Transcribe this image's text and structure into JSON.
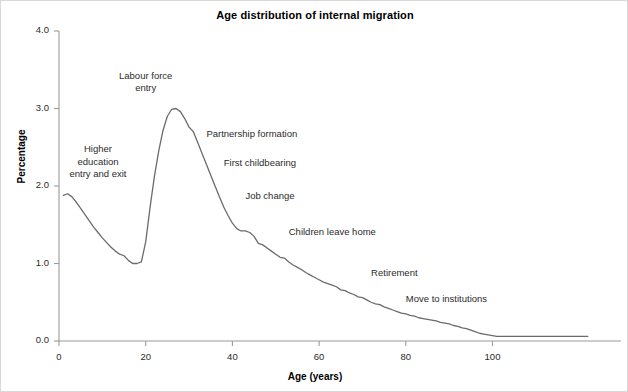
{
  "chart_data": {
    "type": "line",
    "title": "Age distribution of internal migration",
    "xlabel": "Age (years)",
    "ylabel": "Percentage",
    "xlim": [
      0,
      122
    ],
    "ylim": [
      0.0,
      4.0
    ],
    "xticks": [
      0,
      20,
      40,
      60,
      80,
      100
    ],
    "xtick_labels": [
      "0",
      "20",
      "40",
      "60",
      "80",
      "100"
    ],
    "yticks": [
      0.0,
      1.0,
      2.0,
      3.0,
      4.0
    ],
    "ytick_labels": [
      "0.0",
      "1.0",
      "2.0",
      "3.0",
      "4.0"
    ],
    "grid": false,
    "legend": "none",
    "line_color": "#6b6b6b",
    "axis_color": "#9a9a9a",
    "series": [
      {
        "name": "Internal migration rate",
        "x": [
          1,
          2,
          3,
          4,
          5,
          6,
          7,
          8,
          9,
          10,
          11,
          12,
          13,
          14,
          15,
          16,
          17,
          18,
          19,
          20,
          21,
          22,
          23,
          24,
          25,
          26,
          27,
          28,
          29,
          30,
          31,
          32,
          33,
          34,
          35,
          36,
          37,
          38,
          39,
          40,
          41,
          42,
          43,
          44,
          45,
          46,
          47,
          48,
          49,
          50,
          51,
          52,
          53,
          54,
          55,
          56,
          57,
          58,
          59,
          60,
          61,
          62,
          63,
          64,
          65,
          66,
          67,
          68,
          69,
          70,
          71,
          72,
          73,
          74,
          75,
          76,
          77,
          78,
          79,
          80,
          81,
          82,
          83,
          84,
          85,
          86,
          87,
          88,
          89,
          90,
          91,
          92,
          93,
          94,
          95,
          96,
          97,
          98,
          99,
          100,
          101,
          102,
          103,
          104,
          105,
          106,
          107,
          108,
          109,
          110,
          112,
          114,
          116,
          118,
          120,
          122
        ],
        "y": [
          1.88,
          1.9,
          1.86,
          1.79,
          1.71,
          1.63,
          1.55,
          1.47,
          1.4,
          1.33,
          1.27,
          1.21,
          1.16,
          1.12,
          1.1,
          1.04,
          1.0,
          1.0,
          1.02,
          1.28,
          1.72,
          2.12,
          2.45,
          2.72,
          2.9,
          2.99,
          3.0,
          2.96,
          2.87,
          2.76,
          2.7,
          2.56,
          2.42,
          2.28,
          2.14,
          2.0,
          1.86,
          1.73,
          1.62,
          1.52,
          1.45,
          1.42,
          1.42,
          1.4,
          1.35,
          1.26,
          1.24,
          1.2,
          1.16,
          1.12,
          1.08,
          1.07,
          1.02,
          0.98,
          0.95,
          0.92,
          0.88,
          0.85,
          0.82,
          0.79,
          0.76,
          0.74,
          0.72,
          0.7,
          0.66,
          0.65,
          0.62,
          0.6,
          0.57,
          0.56,
          0.53,
          0.5,
          0.48,
          0.47,
          0.44,
          0.42,
          0.4,
          0.38,
          0.36,
          0.35,
          0.33,
          0.32,
          0.3,
          0.29,
          0.28,
          0.27,
          0.26,
          0.24,
          0.23,
          0.22,
          0.2,
          0.19,
          0.17,
          0.16,
          0.14,
          0.12,
          0.1,
          0.09,
          0.08,
          0.07,
          0.06,
          0.06,
          0.06,
          0.06,
          0.06,
          0.06,
          0.06,
          0.06,
          0.06,
          0.06,
          0.06,
          0.06,
          0.06,
          0.06,
          0.06,
          0.06
        ]
      }
    ],
    "annotations": [
      {
        "text": "Labour force\nentry",
        "x": 20,
        "y": 3.5,
        "align": "center"
      },
      {
        "text": "Higher\neducation\nentry and exit",
        "x": 9,
        "y": 2.55,
        "align": "center"
      },
      {
        "text": "Partnership formation",
        "x": 34,
        "y": 2.75,
        "align": "left"
      },
      {
        "text": "First childbearing",
        "x": 38,
        "y": 2.38,
        "align": "left"
      },
      {
        "text": "Job change",
        "x": 43,
        "y": 1.95,
        "align": "left"
      },
      {
        "text": "Children leave home",
        "x": 53,
        "y": 1.48,
        "align": "left"
      },
      {
        "text": "Retirement",
        "x": 72,
        "y": 0.95,
        "align": "left"
      },
      {
        "text": "Move to institutions",
        "x": 80,
        "y": 0.62,
        "align": "left"
      }
    ]
  }
}
